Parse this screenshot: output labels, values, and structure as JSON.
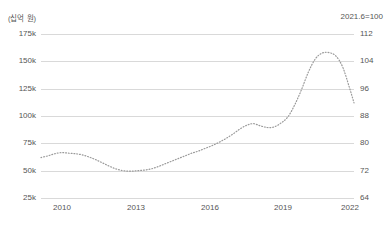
{
  "chart_data": {
    "type": "line",
    "title": "",
    "subtitle": "",
    "unit_label": "(십억 원)",
    "base_note": "2021.6=100",
    "xlabel": "",
    "ylabel": "",
    "grid": true,
    "legend": false,
    "line_style": "dotted",
    "line_color": "#9a9a9a",
    "grid_color": "#d9d9d9",
    "text_color": "#555555",
    "y_left": {
      "ticks": [
        "25k",
        "50k",
        "75k",
        "100k",
        "125k",
        "150k",
        "175k"
      ],
      "values": [
        25000,
        50000,
        75000,
        100000,
        125000,
        150000,
        175000
      ],
      "ylim": [
        25000,
        175000
      ]
    },
    "y_right": {
      "ticks": [
        "64",
        "72",
        "80",
        "88",
        "96",
        "104",
        "112"
      ],
      "values": [
        64,
        72,
        80,
        88,
        96,
        104,
        112
      ],
      "ylim": [
        64,
        112
      ]
    },
    "x_ticks": [
      "2010",
      "2013",
      "2016",
      "2019",
      "2022"
    ],
    "x_tick_values": [
      2010,
      2013,
      2016,
      2019,
      2022
    ],
    "xlim": [
      2009.3,
      2023.0
    ],
    "series": [
      {
        "name": "series-1",
        "x": [
          2009.3,
          2009.6,
          2009.9,
          2010.2,
          2010.5,
          2010.8,
          2011.1,
          2011.4,
          2011.7,
          2012.0,
          2012.3,
          2012.6,
          2012.9,
          2013.2,
          2013.5,
          2013.8,
          2014.1,
          2014.4,
          2014.7,
          2015.0,
          2015.3,
          2015.6,
          2015.9,
          2016.2,
          2016.5,
          2016.8,
          2017.1,
          2017.4,
          2017.7,
          2018.0,
          2018.3,
          2018.6,
          2018.9,
          2019.2,
          2019.5,
          2019.8,
          2020.1,
          2020.4,
          2020.7,
          2021.0,
          2021.3,
          2021.6,
          2021.9,
          2022.2,
          2022.5,
          2022.8,
          2023.0
        ],
        "values": [
          62000,
          63500,
          65500,
          66500,
          66000,
          65500,
          64500,
          62500,
          60000,
          57000,
          54000,
          51500,
          50000,
          49500,
          50000,
          50500,
          51500,
          53500,
          56000,
          58500,
          61000,
          63500,
          66000,
          68000,
          70500,
          73000,
          76000,
          79500,
          83500,
          88000,
          91500,
          93000,
          91000,
          89500,
          90000,
          93500,
          99000,
          110000,
          124000,
          140000,
          152000,
          157500,
          158000,
          155000,
          145000,
          126000,
          112000
        ]
      }
    ]
  }
}
